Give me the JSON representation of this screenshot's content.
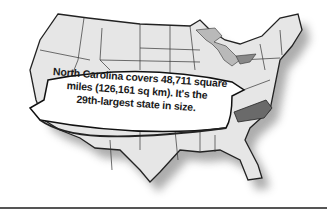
{
  "illustration": {
    "subject": "United States map",
    "highlighted_state": "North Carolina",
    "colors": {
      "map_fill": "#e6e6e6",
      "state_border": "#222222",
      "highlight_fill": "#6a6a6a",
      "great_lakes_fill": "#b9b9b9",
      "banner_fill": "#ffffff",
      "shadow": "#8a8a8a",
      "rule": "#555555"
    }
  },
  "banner": {
    "lines": [
      "North Carolina covers 48,711 square",
      "miles (126,161 sq km). It's the",
      "29th-largest state in size."
    ]
  }
}
